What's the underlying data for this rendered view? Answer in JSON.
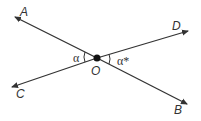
{
  "points": {
    "A": "A",
    "B": "B",
    "C": "C",
    "D": "D",
    "O": "O"
  },
  "angles": {
    "left": "α",
    "right": "α*"
  },
  "colors": {
    "line": "#333333"
  }
}
